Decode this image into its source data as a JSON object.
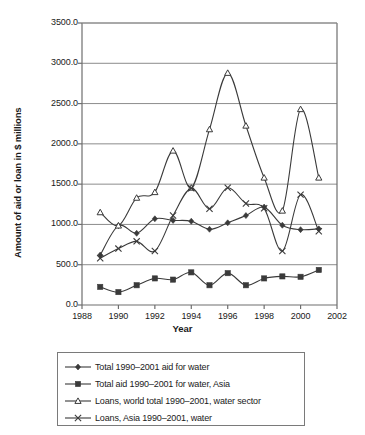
{
  "chart_data": {
    "type": "line",
    "title": "",
    "xlabel": "Year",
    "ylabel": "Amount of aid or loan in $ millions",
    "xlim": [
      1988,
      2002
    ],
    "ylim": [
      0,
      3500
    ],
    "xticks": [
      "1988",
      "1990",
      "1992",
      "1994",
      "1996",
      "1998",
      "2000",
      "2002"
    ],
    "xtick_values": [
      1988,
      1990,
      1992,
      1994,
      1996,
      1998,
      2000,
      2002
    ],
    "yticks": [
      "0.0",
      "500.0",
      "1000.0",
      "1500.0",
      "2000.0",
      "2500.0",
      "3000.0",
      "3500.0"
    ],
    "ytick_values": [
      0,
      500,
      1000,
      1500,
      2000,
      2500,
      3000,
      3500
    ],
    "grid": "horizontal",
    "legend_position": "below-plot",
    "line_style": "smoothed",
    "x": [
      1989,
      1990,
      1991,
      1992,
      1993,
      1994,
      1995,
      1996,
      1997,
      1998,
      1999,
      2000,
      2001
    ],
    "series": [
      {
        "name": "Total 1990–2001 aid for water",
        "marker": "diamond",
        "color": "#3a3a3a",
        "values": [
          620,
          985,
          890,
          1070,
          1050,
          1040,
          940,
          1020,
          1110,
          1215,
          990,
          935,
          945
        ]
      },
      {
        "name": "Total aid 1990–2001 for water, Asia",
        "marker": "square",
        "color": "#3a3a3a",
        "values": [
          225,
          160,
          245,
          330,
          315,
          405,
          245,
          395,
          245,
          330,
          355,
          350,
          435
        ]
      },
      {
        "name": "Loans, world total 1990–2001, water sector",
        "marker": "triangle",
        "color": "#3a3a3a",
        "values": [
          1150,
          985,
          1330,
          1400,
          1915,
          1455,
          2180,
          2880,
          2225,
          1580,
          1170,
          2430,
          1580
        ]
      },
      {
        "name": "Loans, Asia 1990–2001, water",
        "marker": "cross",
        "color": "#3a3a3a",
        "values": [
          580,
          700,
          790,
          670,
          1110,
          1450,
          1195,
          1455,
          1260,
          1200,
          670,
          1370,
          915
        ]
      }
    ]
  },
  "legend": {
    "entries": [
      {
        "label": "Total 1990–2001 aid for water",
        "marker": "diamond"
      },
      {
        "label": "Total aid 1990–2001 for water, Asia",
        "marker": "square"
      },
      {
        "label": "Loans, world total 1990–2001, water sector",
        "marker": "triangle"
      },
      {
        "label": "Loans, Asia 1990–2001, water",
        "marker": "cross"
      }
    ]
  },
  "style": {
    "axis_color": "#6e6e6e",
    "grid_color": "#8c8c8c",
    "line_color": "#3a3a3a",
    "plot_bg": "#ffffff"
  }
}
